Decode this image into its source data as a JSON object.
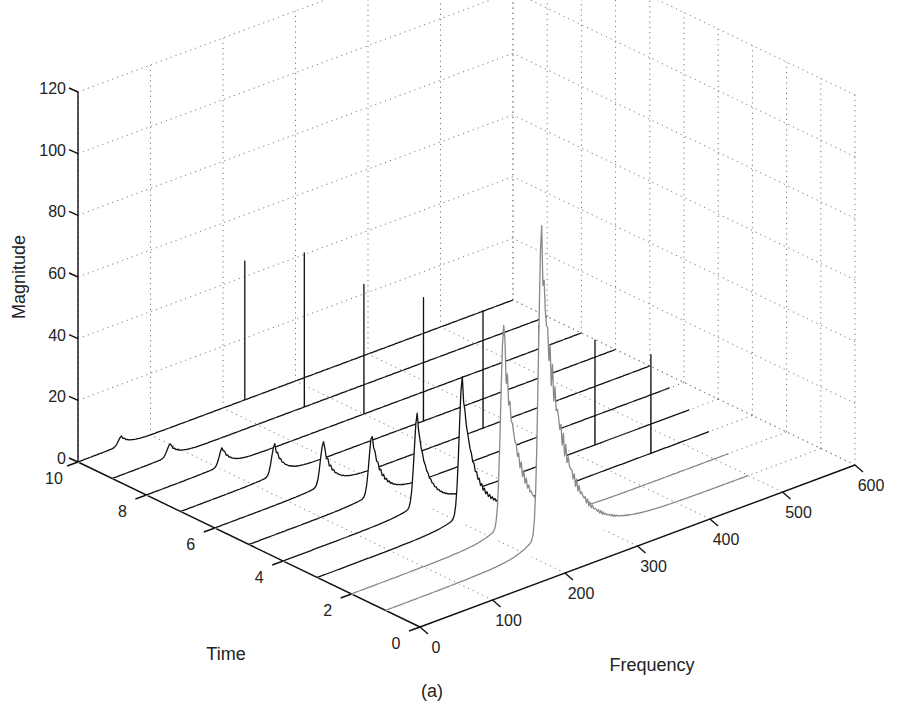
{
  "figure": {
    "caption": "(a)"
  },
  "chart_data": {
    "type": "waterfall_3d",
    "title": "",
    "caption": "(a)",
    "xlabel": "Frequency",
    "ylabel": "Time",
    "zlabel": "Magnitude",
    "xlim": [
      0,
      600
    ],
    "ylim": [
      0,
      10
    ],
    "zlim": [
      0,
      120
    ],
    "xticks": [
      0,
      100,
      200,
      300,
      400,
      500,
      600
    ],
    "yticks": [
      0,
      2,
      4,
      6,
      8,
      10
    ],
    "zticks": [
      0,
      20,
      40,
      60,
      80,
      100,
      120
    ],
    "grid": true,
    "grid_style": "dotted",
    "series": [
      {
        "name": "t=10",
        "time": 10,
        "freq_end": 600,
        "broad_peak": {
          "freq": 60,
          "height": 3
        },
        "narrow_peaks": [
          {
            "freq": 230,
            "height": 45
          }
        ]
      },
      {
        "name": "t=9",
        "time": 9,
        "freq_end": 600,
        "broad_peak": {
          "freq": 80,
          "height": 4
        },
        "narrow_peaks": [
          {
            "freq": 265,
            "height": 50
          }
        ]
      },
      {
        "name": "t=8",
        "time": 8,
        "freq_end": 600,
        "broad_peak": {
          "freq": 105,
          "height": 6
        },
        "narrow_peaks": [
          {
            "freq": 300,
            "height": 42
          }
        ]
      },
      {
        "name": "t=7",
        "time": 7,
        "freq_end": 600,
        "broad_peak": {
          "freq": 130,
          "height": 10
        },
        "narrow_peaks": [
          {
            "freq": 335,
            "height": 40
          }
        ]
      },
      {
        "name": "t=6",
        "time": 6,
        "freq_end": 600,
        "broad_peak": {
          "freq": 150,
          "height": 14
        },
        "narrow_peaks": [
          {
            "freq": 370,
            "height": 38
          }
        ]
      },
      {
        "name": "t=5",
        "time": 5,
        "freq_end": 580,
        "broad_peak": {
          "freq": 170,
          "height": 20
        },
        "narrow_peaks": [
          {
            "freq": 400,
            "height": 36
          }
        ]
      },
      {
        "name": "t=4",
        "time": 4,
        "freq_end": 560,
        "broad_peak": {
          "freq": 185,
          "height": 30
        },
        "narrow_peaks": [
          {
            "freq": 430,
            "height": 34
          }
        ]
      },
      {
        "name": "t=3",
        "time": 3,
        "freq_end": 540,
        "broad_peak": {
          "freq": 200,
          "height": 45
        },
        "narrow_peaks": [
          {
            "freq": 460,
            "height": 32
          }
        ]
      },
      {
        "name": "t=2",
        "time": 2,
        "freq_end": 520,
        "broad_peak": {
          "freq": 210,
          "height": 65
        },
        "narrow_peaks": []
      },
      {
        "name": "t=1",
        "time": 1,
        "freq_end": 500,
        "broad_peak": {
          "freq": 215,
          "height": 100
        },
        "narrow_peaks": []
      }
    ]
  }
}
